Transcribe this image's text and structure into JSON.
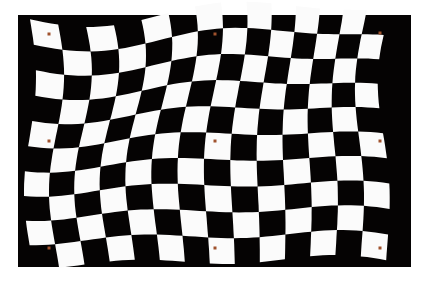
{
  "image": {
    "subject": "warped black-and-white checkerboard calibration pattern",
    "background_color": "#ffffff",
    "panel": {
      "x": 18,
      "y": 15,
      "width": 393,
      "height": 252,
      "color": "#050303"
    },
    "checkerboard": {
      "cols": 14,
      "rows": 10,
      "dark_color": "#050303",
      "light_color": "#fbfbfb",
      "bounds": {
        "x0": 30,
        "y0": 12,
        "x1": 396,
        "y1": 262
      }
    },
    "markers": {
      "color": "#a0522d",
      "size": 3,
      "points": [
        [
          49,
          34
        ],
        [
          215,
          34
        ],
        [
          380,
          33
        ],
        [
          49,
          141
        ],
        [
          215,
          141
        ],
        [
          380,
          141
        ],
        [
          49,
          248
        ],
        [
          215,
          248
        ],
        [
          380,
          248
        ]
      ]
    }
  }
}
